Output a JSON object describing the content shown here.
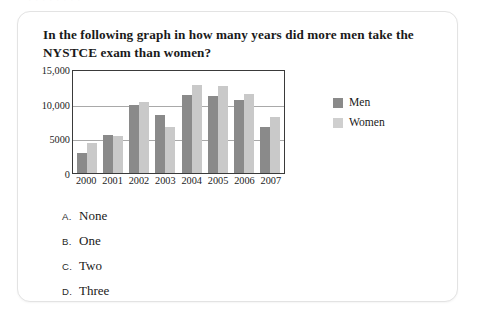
{
  "page": {
    "top_bleed_text": "·   ·      ·        ·        ·     ·   ·  ·"
  },
  "question": {
    "text": "In the following graph in how many years did more men take the NYSTCE exam than women?"
  },
  "legend": {
    "men_label": "Men",
    "women_label": "Women"
  },
  "colors": {
    "men": "#8a8a8a",
    "women": "#c9c9c9",
    "axis": "#3a3a3a",
    "gridline": "#a9a9a9",
    "card_border": "#e3e3e3"
  },
  "options": [
    {
      "letter": "A.",
      "text": "None"
    },
    {
      "letter": "B.",
      "text": "One"
    },
    {
      "letter": "C.",
      "text": "Two"
    },
    {
      "letter": "D.",
      "text": "Three"
    }
  ],
  "chart_data": {
    "type": "bar",
    "title": "",
    "xlabel": "",
    "ylabel": "",
    "categories": [
      "2000",
      "2001",
      "2002",
      "2003",
      "2004",
      "2005",
      "2006",
      "2007"
    ],
    "series": [
      {
        "name": "Men",
        "values": [
          2900,
          5500,
          9800,
          8400,
          11300,
          11100,
          10500,
          6700
        ]
      },
      {
        "name": "Women",
        "values": [
          4400,
          5300,
          10300,
          6700,
          12700,
          12600,
          11400,
          8100
        ]
      }
    ],
    "ylim": [
      0,
      15000
    ],
    "yticks": [
      0,
      5000,
      10000,
      15000
    ],
    "ytick_labels": [
      "0",
      "5000",
      "10,000",
      "15,000"
    ],
    "grid": true,
    "legend_position": "right"
  }
}
